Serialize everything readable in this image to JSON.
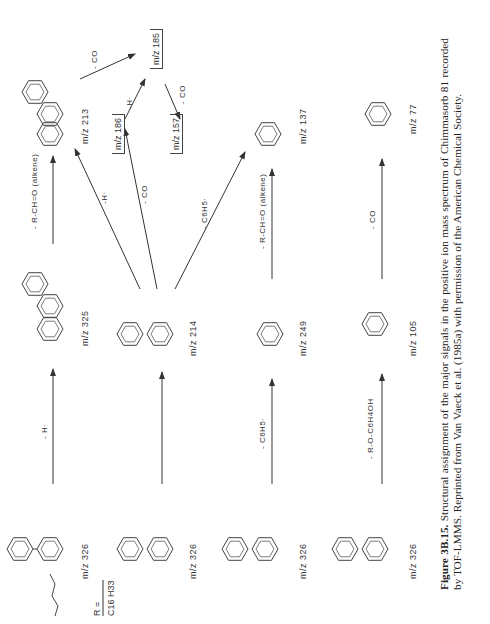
{
  "figure": {
    "label": "Figure 3B.15.",
    "caption": "Structural assignment of the major signals in the positive ion mass spectrum of Chimmasorb 81 recorded by TOF-LMMS. Reprinted from Van Vaeck et al. (1985a) with permission of the American Chemical Society."
  },
  "r_definition": {
    "lhs": "R =",
    "rhs": "C16 H33"
  },
  "ions": [
    {
      "id": "row1-parent",
      "label": "m/z  326"
    },
    {
      "id": "row1-product",
      "label": "m/z  325"
    },
    {
      "id": "row1-final",
      "label": "m/z  213"
    },
    {
      "id": "row2-parent",
      "label": "m/z  326"
    },
    {
      "id": "row2-product",
      "label": "m/z  214"
    },
    {
      "id": "row3-parent",
      "label": "m/z  326"
    },
    {
      "id": "row3-product",
      "label": "m/z  249"
    },
    {
      "id": "row3-final",
      "label": "m/z  137"
    },
    {
      "id": "row4-parent",
      "label": "m/z  326"
    },
    {
      "id": "row4-product",
      "label": "m/z  105"
    },
    {
      "id": "row4-final",
      "label": "m/z  77"
    },
    {
      "id": "ion-186",
      "label": "m/z  186"
    },
    {
      "id": "ion-185",
      "label": "m/z  185"
    },
    {
      "id": "ion-157",
      "label": "m/z  157"
    }
  ],
  "losses": {
    "row1_step1": "- H·",
    "row1_step2": "- R-CH=O (alkene)",
    "from214_to213": "-H·",
    "from214_to186": "- CO",
    "from214_to137": "- C6H5·",
    "from186_to185": "-H·",
    "from213_to185": "- CO",
    "from185_to157": "- CO",
    "row3_step1": "- C6H5·",
    "row3_step2": "- R-CH=O (alkene)",
    "row4_step1": "- R-O-C6H4OH",
    "row4_step2": "- CO"
  },
  "atoms": {
    "oxo": "O",
    "hydroxyl": "OH",
    "ho": "HO",
    "r": "R",
    "h": "H",
    "oh_plus": "+O H",
    "acylium": "C≡O"
  }
}
